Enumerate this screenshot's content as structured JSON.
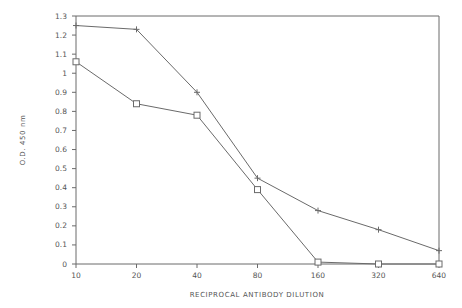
{
  "chart_data": {
    "type": "line",
    "title": "",
    "xlabel": "RECIPROCAL ANTIBODY DILUTION",
    "ylabel": "O.D. 450 nm",
    "categories": [
      "10",
      "20",
      "40",
      "80",
      "160",
      "320",
      "640"
    ],
    "yticks": [
      "0",
      "0.1",
      "0.2",
      "0.3",
      "0.4",
      "0.5",
      "0.6",
      "0.7",
      "0.8",
      "0.9",
      "1",
      "1.1",
      "1.2",
      "1.3"
    ],
    "ylim": [
      0,
      1.3
    ],
    "grid": false,
    "legend": null,
    "series": [
      {
        "name": "plus-marker series",
        "marker": "plus",
        "values": [
          1.25,
          1.23,
          0.9,
          0.45,
          0.28,
          0.18,
          0.07
        ]
      },
      {
        "name": "square-marker series",
        "marker": "square",
        "values": [
          1.06,
          0.84,
          0.78,
          0.39,
          0.01,
          0.0,
          0.0
        ]
      }
    ],
    "colors": {
      "line": "#6a6a6a",
      "axis": "#6a6a6a",
      "text": "#555555"
    }
  }
}
